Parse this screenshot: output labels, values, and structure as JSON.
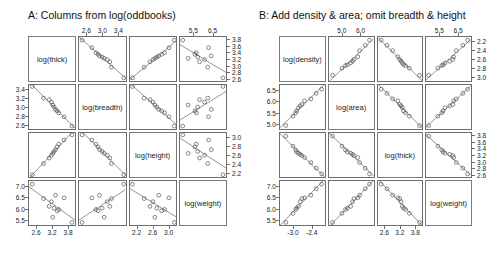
{
  "figure": {
    "width": 502,
    "height": 272,
    "background": "#ffffff",
    "marker_color": "#555555",
    "line_color": "#666666",
    "frame_color": "#6e6e6e"
  },
  "panels": [
    {
      "id": "A",
      "title": "A: Columns from log(oddbooks)",
      "variables": [
        "log(thick)",
        "log(breadth)",
        "log(height)",
        "log(weight)"
      ],
      "axes": {
        "top": [
          {
            "col": 2,
            "ticks": [
              "2.6",
              "3.0",
              "3.4"
            ]
          },
          {
            "col": 4,
            "ticks": [
              "5.5",
              "6.5"
            ]
          }
        ],
        "bottom": [
          {
            "col": 1,
            "ticks": [
              "2.6",
              "3.2",
              "3.8"
            ]
          },
          {
            "col": 3,
            "ticks": [
              "2.2",
              "2.6",
              "3.0"
            ]
          }
        ],
        "left": [
          {
            "row": 2,
            "ticks": [
              "3.4",
              "3.2",
              "3.0",
              "2.8",
              "2.6"
            ]
          },
          {
            "row": 4,
            "ticks": [
              "7.0",
              "6.5",
              "6.0",
              "5.5"
            ]
          }
        ],
        "right": [
          {
            "row": 1,
            "ticks": [
              "3.8",
              "3.6",
              "3.4",
              "3.2",
              "3.0",
              "2.8",
              "2.6"
            ]
          },
          {
            "row": 3,
            "ticks": [
              "3.0",
              "2.8",
              "2.6",
              "2.4",
              "2.2"
            ]
          }
        ]
      }
    },
    {
      "id": "B",
      "title": "B: Add density & area; omit breadth & height",
      "variables": [
        "log(density)",
        "log(area)",
        "log(thick)",
        "log(weight)"
      ],
      "axes": {
        "top": [
          {
            "col": 2,
            "ticks": [
              "5.0",
              "6.0"
            ]
          },
          {
            "col": 4,
            "ticks": [
              "5.5",
              "6.5"
            ]
          }
        ],
        "bottom": [
          {
            "col": 1,
            "ticks": [
              "-3.0",
              "-2.4"
            ]
          },
          {
            "col": 3,
            "ticks": [
              "2.6",
              "3.2",
              "3.8"
            ]
          }
        ],
        "left": [
          {
            "row": 2,
            "ticks": [
              "6.5",
              "6.0",
              "5.5",
              "5.0"
            ]
          },
          {
            "row": 4,
            "ticks": [
              "7.0",
              "6.5",
              "6.0",
              "5.5"
            ]
          }
        ],
        "right": [
          {
            "row": 1,
            "ticks": [
              "2.2",
              "2.4",
              "2.6",
              "2.8",
              "3.0"
            ]
          },
          {
            "row": 3,
            "ticks": [
              "3.8",
              "3.6",
              "3.4",
              "3.2",
              "3.0",
              "2.8",
              "2.6"
            ]
          }
        ]
      }
    }
  ],
  "chart_data": {
    "type": "scatter",
    "layout": "two 4x4 scatterplot matrices side by side",
    "grid": "on",
    "legend": "none",
    "matrices": [
      {
        "panel": "A",
        "title": "A: Columns from log(oddbooks)",
        "variables": [
          "log(thick)",
          "log(breadth)",
          "log(height)",
          "log(weight)"
        ],
        "axis_ranges": {
          "log(thick)": [
            2.5,
            3.9
          ],
          "log(breadth)": [
            2.55,
            3.45
          ],
          "log(height)": [
            2.15,
            3.1
          ],
          "log(weight)": [
            5.4,
            7.1
          ]
        },
        "points": {
          "log(thick)": [
            2.6,
            2.94,
            3.11,
            3.18,
            3.22,
            3.26,
            3.3,
            3.35,
            3.4,
            3.56,
            3.8
          ],
          "log(breadth)": [
            3.42,
            3.18,
            3.15,
            3.1,
            3.04,
            3.0,
            2.95,
            2.92,
            2.88,
            2.8,
            2.61
          ],
          "log(height)": [
            2.2,
            2.44,
            2.56,
            2.62,
            2.66,
            2.7,
            2.74,
            2.8,
            2.86,
            2.95,
            3.06
          ],
          "log(weight)": [
            6.98,
            6.42,
            6.12,
            6.3,
            5.7,
            6.05,
            6.55,
            5.95,
            6.0,
            6.45,
            5.5
          ]
        },
        "relationships": [
          {
            "x": "log(thick)",
            "y": "log(breadth)",
            "trend": "negative",
            "strength": "strong"
          },
          {
            "x": "log(thick)",
            "y": "log(height)",
            "trend": "negative",
            "strength": "strong"
          },
          {
            "x": "log(thick)",
            "y": "log(weight)",
            "trend": "negative",
            "strength": "moderate"
          },
          {
            "x": "log(breadth)",
            "y": "log(height)",
            "trend": "positive",
            "strength": "strong"
          },
          {
            "x": "log(breadth)",
            "y": "log(weight)",
            "trend": "positive",
            "strength": "moderate"
          },
          {
            "x": "log(height)",
            "y": "log(weight)",
            "trend": "positive",
            "strength": "moderate"
          }
        ]
      },
      {
        "panel": "B",
        "title": "B: Add density & area; omit breadth & height",
        "variables": [
          "log(density)",
          "log(area)",
          "log(thick)",
          "log(weight)"
        ],
        "axis_ranges": {
          "log(density)": [
            -3.15,
            -2.15
          ],
          "log(area)": [
            4.8,
            6.7
          ],
          "log(thick)": [
            2.5,
            3.9
          ],
          "log(weight)": [
            5.4,
            7.1
          ]
        },
        "points": {
          "log(density)": [
            -3.02,
            -2.86,
            -2.8,
            -2.78,
            -2.74,
            -2.7,
            -2.66,
            -2.6,
            -2.46,
            -2.34,
            -2.22
          ],
          "log(area)": [
            4.95,
            5.35,
            5.5,
            5.58,
            5.72,
            5.8,
            5.86,
            6.02,
            6.1,
            6.34,
            6.52
          ],
          "log(thick)": [
            3.8,
            3.48,
            3.36,
            3.3,
            3.26,
            3.22,
            3.18,
            3.12,
            2.96,
            2.78,
            2.6
          ],
          "log(weight)": [
            5.5,
            5.85,
            6.0,
            6.05,
            6.12,
            6.3,
            6.42,
            6.45,
            6.55,
            6.8,
            6.98
          ]
        },
        "relationships": [
          {
            "x": "log(density)",
            "y": "log(area)",
            "trend": "positive",
            "strength": "strong"
          },
          {
            "x": "log(density)",
            "y": "log(thick)",
            "trend": "negative",
            "strength": "strong"
          },
          {
            "x": "log(density)",
            "y": "log(weight)",
            "trend": "positive",
            "strength": "strong"
          },
          {
            "x": "log(area)",
            "y": "log(thick)",
            "trend": "negative",
            "strength": "strong"
          },
          {
            "x": "log(area)",
            "y": "log(weight)",
            "trend": "positive",
            "strength": "strong"
          },
          {
            "x": "log(thick)",
            "y": "log(weight)",
            "trend": "negative",
            "strength": "strong"
          }
        ]
      }
    ]
  }
}
